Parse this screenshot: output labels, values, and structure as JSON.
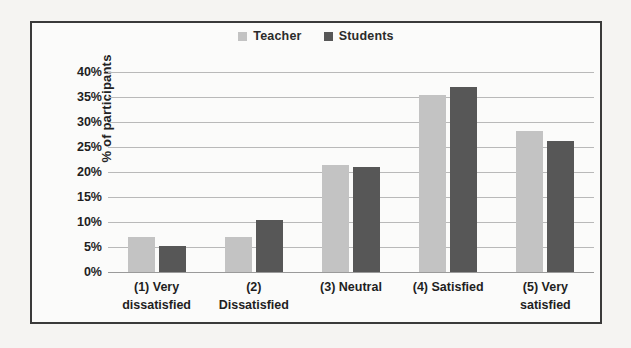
{
  "chart_data": {
    "type": "bar",
    "title": "",
    "subtitle": "",
    "xlabel": "",
    "ylabel": "% of participants",
    "ylim": [
      0,
      40
    ],
    "ytick_labels": [
      "40%",
      "35%",
      "30%",
      "25%",
      "20%",
      "15%",
      "10%",
      "5%",
      "0%"
    ],
    "ytick_values": [
      40,
      35,
      30,
      25,
      20,
      15,
      10,
      5,
      0
    ],
    "grid": true,
    "legend_position": "top-center",
    "categories": [
      "(1) Very dissatisfied",
      "(2) Dissatisfied",
      "(3) Neutral",
      "(4) Satisfied",
      "(5) Very satisfied"
    ],
    "category_lines": [
      [
        "(1) Very",
        "dissatisfied"
      ],
      [
        "(2)",
        "Dissatisfied"
      ],
      [
        "(3) Neutral"
      ],
      [
        "(4) Satisfied"
      ],
      [
        "(5) Very",
        "satisfied"
      ]
    ],
    "series": [
      {
        "name": "Teacher",
        "color": "#c3c3c3",
        "values": [
          7.0,
          7.0,
          21.5,
          35.5,
          28.2
        ]
      },
      {
        "name": "Students",
        "color": "#575757",
        "values": [
          5.2,
          10.5,
          21.0,
          37.0,
          26.2
        ]
      }
    ]
  },
  "legend": {
    "items": [
      {
        "label": "Teacher",
        "color": "#c3c3c3"
      },
      {
        "label": "Students",
        "color": "#575757"
      }
    ]
  },
  "axis": {
    "y_title": "% of participants"
  }
}
